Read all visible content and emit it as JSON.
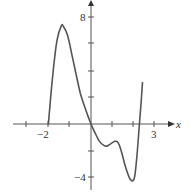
{
  "chart_data": {
    "type": "line",
    "title": "",
    "xlabel": "x",
    "ylabel": "",
    "xlim": [
      -3.0,
      3.7
    ],
    "ylim": [
      -5.0,
      9.3
    ],
    "grid": false,
    "x_ticks": [
      -3,
      -2,
      -1,
      0,
      1,
      2,
      3
    ],
    "x_tick_labels": [
      {
        "value": -2,
        "label": "−2"
      },
      {
        "value": 3,
        "label": "3"
      }
    ],
    "y_ticks": [
      -4,
      -2,
      2,
      4,
      6,
      8
    ],
    "y_tick_labels": [
      {
        "value": 8,
        "label": "8"
      },
      {
        "value": -4,
        "label": "−4"
      }
    ],
    "series": [
      {
        "name": "f(x)",
        "color": "#555555",
        "x": [
          -2.0,
          -1.8,
          -1.6,
          -1.4,
          -1.3,
          -1.1,
          -0.9,
          -0.7,
          -0.5,
          -0.3,
          -0.1,
          0.0,
          0.2,
          0.4,
          0.6,
          0.75,
          0.9,
          1.1,
          1.25,
          1.4,
          1.6,
          1.8,
          1.95,
          2.05,
          2.15,
          2.25,
          2.35,
          2.42
        ],
        "values": [
          0.0,
          3.6,
          6.2,
          7.3,
          7.3,
          6.6,
          5.2,
          3.7,
          2.3,
          1.3,
          0.4,
          0.0,
          -0.7,
          -1.3,
          -1.6,
          -1.65,
          -1.5,
          -1.3,
          -1.35,
          -1.9,
          -3.1,
          -4.0,
          -4.25,
          -3.9,
          -2.5,
          -0.5,
          1.6,
          3.1
        ]
      }
    ]
  },
  "axes": {
    "x_label": "x",
    "x_tick_label_neg2": "−2",
    "x_tick_label_3": "3",
    "y_tick_label_8": "8",
    "y_tick_label_neg4": "−4"
  }
}
